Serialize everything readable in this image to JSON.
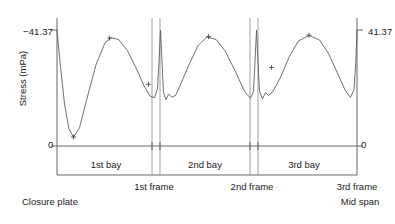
{
  "axes": {
    "y_title": "Stress (mPa)",
    "tick_top_left": "−41.37",
    "tick_top_right": "41.37",
    "tick_zero_left": "0",
    "tick_zero_right": "0"
  },
  "bays": [
    {
      "label": "1st bay"
    },
    {
      "label": "2nd bay"
    },
    {
      "label": "3rd bay"
    }
  ],
  "frames": [
    {
      "label": "1st frame"
    },
    {
      "label": "2nd frame"
    },
    {
      "label": "3rd frame"
    }
  ],
  "annotations": {
    "left_end": "Closure plate",
    "right_end": "Mid span"
  },
  "colors": {
    "curve": "#555555",
    "axis": "#555555",
    "frame_line": "#888888",
    "text": "#222222",
    "background": "#ffffff"
  },
  "chart_data": {
    "type": "line",
    "title": "",
    "xlabel": "",
    "ylabel": "Stress (mPa)",
    "ylim": [
      -41.37,
      0
    ],
    "y_ticks": [
      -41.37,
      0
    ],
    "y_tick_labels": [
      "−41.37",
      "0"
    ],
    "grid": false,
    "legend": null,
    "x_regions": [
      {
        "name": "1st bay",
        "start": 0.0,
        "end": 0.335
      },
      {
        "name": "2nd bay",
        "start": 0.355,
        "end": 0.655
      },
      {
        "name": "3rd bay",
        "start": 0.675,
        "end": 1.0
      }
    ],
    "x_boundaries": [
      {
        "name": "Closure plate",
        "x": 0.0
      },
      {
        "name": "1st frame",
        "x": 0.345
      },
      {
        "name": "2nd frame",
        "x": 0.665
      },
      {
        "name": "3rd frame / Mid span",
        "x": 1.0
      }
    ],
    "markers": [
      {
        "x": 0.055,
        "y": -3.2,
        "type": "+",
        "note": "1st bay minimum"
      },
      {
        "x": 0.175,
        "y": -38.5,
        "type": "+",
        "note": "1st bay peak"
      },
      {
        "x": 0.305,
        "y": -22.0,
        "type": "+",
        "note": "near 1st frame"
      },
      {
        "x": 0.505,
        "y": -39.0,
        "type": "+",
        "note": "2nd bay peak"
      },
      {
        "x": 0.715,
        "y": -28.0,
        "type": "+",
        "note": "3rd bay rise"
      },
      {
        "x": 0.84,
        "y": -39.5,
        "type": "+",
        "note": "3rd bay peak"
      }
    ],
    "series": [
      {
        "name": "Stress along girder",
        "points": [
          [
            0.0,
            -41.37
          ],
          [
            0.01,
            -30.0
          ],
          [
            0.025,
            -15.0
          ],
          [
            0.04,
            -6.0
          ],
          [
            0.055,
            -3.2
          ],
          [
            0.075,
            -6.5
          ],
          [
            0.1,
            -17.0
          ],
          [
            0.13,
            -29.0
          ],
          [
            0.16,
            -36.8
          ],
          [
            0.18,
            -38.6
          ],
          [
            0.205,
            -38.0
          ],
          [
            0.235,
            -34.0
          ],
          [
            0.265,
            -27.5
          ],
          [
            0.29,
            -21.5
          ],
          [
            0.31,
            -17.8
          ],
          [
            0.325,
            -17.2
          ],
          [
            0.335,
            -20.5
          ],
          [
            0.34,
            -30.0
          ],
          [
            0.345,
            -41.37
          ],
          [
            0.35,
            -30.0
          ],
          [
            0.355,
            -19.0
          ],
          [
            0.363,
            -16.5
          ],
          [
            0.372,
            -18.5
          ],
          [
            0.382,
            -17.4
          ],
          [
            0.395,
            -18.0
          ],
          [
            0.41,
            -21.5
          ],
          [
            0.44,
            -29.0
          ],
          [
            0.47,
            -35.8
          ],
          [
            0.5,
            -38.9
          ],
          [
            0.53,
            -38.0
          ],
          [
            0.56,
            -34.0
          ],
          [
            0.595,
            -26.5
          ],
          [
            0.625,
            -19.5
          ],
          [
            0.645,
            -17.0
          ],
          [
            0.655,
            -19.5
          ],
          [
            0.66,
            -30.0
          ],
          [
            0.665,
            -41.37
          ],
          [
            0.67,
            -30.0
          ],
          [
            0.675,
            -19.5
          ],
          [
            0.685,
            -16.8
          ],
          [
            0.695,
            -19.0
          ],
          [
            0.705,
            -18.0
          ],
          [
            0.72,
            -19.5
          ],
          [
            0.745,
            -24.5
          ],
          [
            0.775,
            -32.0
          ],
          [
            0.805,
            -37.5
          ],
          [
            0.84,
            -39.4
          ],
          [
            0.875,
            -37.8
          ],
          [
            0.905,
            -33.0
          ],
          [
            0.935,
            -26.0
          ],
          [
            0.96,
            -20.0
          ],
          [
            0.978,
            -17.3
          ],
          [
            0.99,
            -20.0
          ],
          [
            0.996,
            -30.0
          ],
          [
            1.0,
            -41.37
          ]
        ]
      }
    ]
  }
}
